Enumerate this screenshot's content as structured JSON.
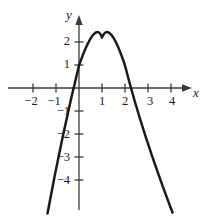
{
  "figure": {
    "kind": "cartesian-graph",
    "background_color": "#ffffff",
    "ink_color": "#1a1a1a",
    "curve_color": "#1a1a1a",
    "axis_color": "#3a3a3a"
  },
  "labels": {
    "x_axis": "x",
    "y_axis": "y"
  },
  "chart_data": {
    "type": "line",
    "title": "",
    "xlabel": "x",
    "ylabel": "y",
    "grid": false,
    "legend": null,
    "xlim": [
      -2.9,
      4.9
    ],
    "ylim": [
      -5.4,
      2.7
    ],
    "x_ticks": [
      -2,
      -1,
      1,
      2,
      3,
      4
    ],
    "y_ticks": [
      2,
      1,
      -1,
      -2,
      -3,
      -4
    ],
    "x_tick_labels": [
      "−2",
      "−1",
      "1",
      "2",
      "3",
      "4"
    ],
    "y_tick_labels": [
      "2",
      "1",
      "−1",
      "−2",
      "−3",
      "−4"
    ],
    "series": [
      {
        "name": "parabola",
        "shape": "downward-parabola",
        "vertex": [
          1,
          2.2
        ],
        "y_intercept": 1,
        "x_intercepts": [
          -0.45,
          2.45
        ],
        "leading_coefficient": -2.2,
        "x": [
          -1.35,
          -1.2,
          -1.0,
          -0.8,
          -0.6,
          -0.45,
          -0.2,
          0,
          0.2,
          0.4,
          0.6,
          0.8,
          1.0,
          1.2,
          1.4,
          1.6,
          1.8,
          2.0,
          2.2,
          2.45,
          2.6,
          2.8,
          3.0,
          3.2,
          3.4
        ],
        "y": [
          -10.0,
          -8.5,
          -6.4,
          -4.6,
          -3.1,
          -2.2,
          -0.9,
          1.0,
          1.65,
          2.0,
          2.15,
          2.2,
          2.2,
          2.1,
          1.85,
          1.4,
          0.8,
          0.0,
          -0.9,
          -2.2,
          -3.1,
          -4.6,
          -6.4,
          -8.5,
          -10.0
        ]
      }
    ]
  },
  "tick_labels_x": [
    {
      "text": "−2",
      "px": 31
    },
    {
      "text": "−1",
      "px": 54
    },
    {
      "text": "1",
      "px": 102
    },
    {
      "text": "2",
      "px": 125
    },
    {
      "text": "3",
      "px": 150
    },
    {
      "text": "4",
      "px": 172
    }
  ],
  "tick_labels_y": [
    {
      "text": "2",
      "py": 41
    },
    {
      "text": "1",
      "py": 64
    },
    {
      "text": "−1",
      "py": 111
    },
    {
      "text": "−2",
      "py": 134
    },
    {
      "text": "−3",
      "py": 157
    },
    {
      "text": "−4",
      "py": 180
    }
  ]
}
